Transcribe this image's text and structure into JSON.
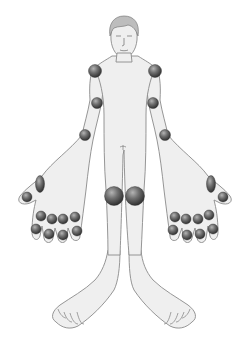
{
  "diagram": {
    "title": "",
    "colors": {
      "background": "#ffffff",
      "skin_fill": "#efefef",
      "outline": "#8a8a8a",
      "joint_marker_light": "#a8a8a8",
      "joint_marker_dark": "#3a3a3a"
    },
    "joints": [
      {
        "name": "left-shoulder",
        "cx": 95,
        "cy": 71,
        "r": 6.5,
        "ry": 6.5
      },
      {
        "name": "right-shoulder",
        "cx": 155,
        "cy": 71,
        "r": 6.5,
        "ry": 6.5
      },
      {
        "name": "left-elbow",
        "cx": 97,
        "cy": 103,
        "r": 5.5,
        "ry": 5.5
      },
      {
        "name": "right-elbow",
        "cx": 153,
        "cy": 103,
        "r": 5.5,
        "ry": 5.5
      },
      {
        "name": "left-wrist",
        "cx": 85,
        "cy": 135,
        "r": 5.5,
        "ry": 5.5
      },
      {
        "name": "right-wrist",
        "cx": 165,
        "cy": 135,
        "r": 5.5,
        "ry": 5.5
      },
      {
        "name": "left-thumb-cmc",
        "cx": 40,
        "cy": 184,
        "r": 4.5,
        "ry": 8.5
      },
      {
        "name": "right-thumb-cmc",
        "cx": 211,
        "cy": 184,
        "r": 4.5,
        "ry": 8.5
      },
      {
        "name": "left-thumb-ip",
        "cx": 27,
        "cy": 197,
        "r": 5,
        "ry": 5
      },
      {
        "name": "right-thumb-ip",
        "cx": 223,
        "cy": 197,
        "r": 5,
        "ry": 5
      },
      {
        "name": "left-knee",
        "cx": 114,
        "cy": 196,
        "r": 9.5,
        "ry": 9.5
      },
      {
        "name": "right-knee",
        "cx": 135,
        "cy": 196,
        "r": 9.5,
        "ry": 9.5
      },
      {
        "name": "left-mcp-2",
        "cx": 41,
        "cy": 216,
        "r": 5,
        "ry": 5
      },
      {
        "name": "left-mcp-3",
        "cx": 52,
        "cy": 219,
        "r": 5,
        "ry": 5
      },
      {
        "name": "left-mcp-4",
        "cx": 63,
        "cy": 219,
        "r": 5,
        "ry": 5
      },
      {
        "name": "left-mcp-5",
        "cx": 75,
        "cy": 217,
        "r": 5,
        "ry": 5
      },
      {
        "name": "left-pip-2",
        "cx": 36,
        "cy": 229,
        "r": 5,
        "ry": 5
      },
      {
        "name": "left-pip-3",
        "cx": 49,
        "cy": 234,
        "r": 5,
        "ry": 5
      },
      {
        "name": "left-pip-4",
        "cx": 63,
        "cy": 235,
        "r": 5,
        "ry": 5
      },
      {
        "name": "left-pip-5",
        "cx": 77,
        "cy": 231,
        "r": 5,
        "ry": 5
      },
      {
        "name": "right-mcp-2",
        "cx": 209,
        "cy": 215,
        "r": 5,
        "ry": 5
      },
      {
        "name": "right-mcp-3",
        "cx": 198,
        "cy": 219,
        "r": 5,
        "ry": 5
      },
      {
        "name": "right-mcp-4",
        "cx": 186,
        "cy": 219,
        "r": 5,
        "ry": 5
      },
      {
        "name": "right-mcp-5",
        "cx": 175,
        "cy": 217,
        "r": 5,
        "ry": 5
      },
      {
        "name": "right-pip-2",
        "cx": 213,
        "cy": 229,
        "r": 5,
        "ry": 5
      },
      {
        "name": "right-pip-3",
        "cx": 200,
        "cy": 234,
        "r": 5,
        "ry": 5
      },
      {
        "name": "right-pip-4",
        "cx": 187,
        "cy": 235,
        "r": 5,
        "ry": 5
      },
      {
        "name": "right-pip-5",
        "cx": 173,
        "cy": 230,
        "r": 5,
        "ry": 5
      }
    ]
  }
}
